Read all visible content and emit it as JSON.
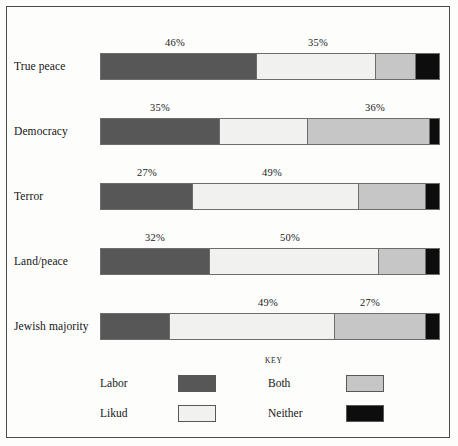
{
  "figure": {
    "key_title": "KEY"
  },
  "chart_data": {
    "type": "bar",
    "orientation": "horizontal",
    "stacked": true,
    "normalized": true,
    "title": "",
    "subtitle": "",
    "xlabel": "",
    "ylabel": "",
    "xlim": [
      0,
      100
    ],
    "grid": false,
    "legend_position": "bottom",
    "legend_title": "KEY",
    "categories": [
      "True peace",
      "Democracy",
      "Terror",
      "Land/peace",
      "Jewish majority"
    ],
    "series": [
      {
        "name": "Labor",
        "color": "#575757",
        "values": [
          46,
          35,
          27,
          32,
          20
        ]
      },
      {
        "name": "Likud",
        "color": "#f1f1ef",
        "values": [
          35,
          26,
          49,
          50,
          49
        ]
      },
      {
        "name": "Both",
        "color": "#c6c6c6",
        "values": [
          12,
          36,
          20,
          14,
          27
        ]
      },
      {
        "name": "Neither",
        "color": "#0d0d0d",
        "values": [
          7,
          3,
          4,
          4,
          4
        ]
      }
    ],
    "annotations": [
      {
        "row": "True peace",
        "series": "Labor",
        "text": "46%"
      },
      {
        "row": "True peace",
        "series": "Likud",
        "text": "35%"
      },
      {
        "row": "Democracy",
        "series": "Labor",
        "text": "35%"
      },
      {
        "row": "Democracy",
        "series": "Both",
        "text": "36%"
      },
      {
        "row": "Terror",
        "series": "Labor",
        "text": "27%"
      },
      {
        "row": "Terror",
        "series": "Likud",
        "text": "49%"
      },
      {
        "row": "Land/peace",
        "series": "Labor",
        "text": "32%"
      },
      {
        "row": "Land/peace",
        "series": "Likud",
        "text": "50%"
      },
      {
        "row": "Jewish majority",
        "series": "Likud",
        "text": "49%"
      },
      {
        "row": "Jewish majority",
        "series": "Both",
        "text": "27%"
      }
    ]
  },
  "rows": [
    {
      "label": "True peace",
      "segments": [
        {
          "name": "Labor",
          "value": 46
        },
        {
          "name": "Likud",
          "value": 35
        },
        {
          "name": "Both",
          "value": 12
        },
        {
          "name": "Neither",
          "value": 7
        }
      ],
      "labels": [
        {
          "text": "46%",
          "x": 175
        },
        {
          "text": "35%",
          "x": 318
        }
      ]
    },
    {
      "label": "Democracy",
      "segments": [
        {
          "name": "Labor",
          "value": 35
        },
        {
          "name": "Likud",
          "value": 26
        },
        {
          "name": "Both",
          "value": 36
        },
        {
          "name": "Neither",
          "value": 3
        }
      ],
      "labels": [
        {
          "text": "35%",
          "x": 160
        },
        {
          "text": "36%",
          "x": 375
        }
      ]
    },
    {
      "label": "Terror",
      "segments": [
        {
          "name": "Labor",
          "value": 27
        },
        {
          "name": "Likud",
          "value": 49
        },
        {
          "name": "Both",
          "value": 20
        },
        {
          "name": "Neither",
          "value": 4
        }
      ],
      "labels": [
        {
          "text": "27%",
          "x": 147
        },
        {
          "text": "49%",
          "x": 272
        }
      ]
    },
    {
      "label": "Land/peace",
      "segments": [
        {
          "name": "Labor",
          "value": 32
        },
        {
          "name": "Likud",
          "value": 50
        },
        {
          "name": "Both",
          "value": 14
        },
        {
          "name": "Neither",
          "value": 4
        }
      ],
      "labels": [
        {
          "text": "32%",
          "x": 155
        },
        {
          "text": "50%",
          "x": 290
        }
      ]
    },
    {
      "label": "Jewish majority",
      "segments": [
        {
          "name": "Labor",
          "value": 20
        },
        {
          "name": "Likud",
          "value": 49
        },
        {
          "name": "Both",
          "value": 27
        },
        {
          "name": "Neither",
          "value": 4
        }
      ],
      "labels": [
        {
          "text": "49%",
          "x": 268
        },
        {
          "text": "27%",
          "x": 370
        }
      ]
    }
  ],
  "legend": {
    "title": "KEY",
    "items": [
      {
        "label": "Labor",
        "color": "#575757",
        "col": 0,
        "row": 0
      },
      {
        "label": "Likud",
        "color": "#f1f1ef",
        "col": 0,
        "row": 1
      },
      {
        "label": "Both",
        "color": "#c6c6c6",
        "col": 1,
        "row": 0
      },
      {
        "label": "Neither",
        "color": "#0d0d0d",
        "col": 1,
        "row": 1
      }
    ]
  }
}
